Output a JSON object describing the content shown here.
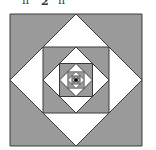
{
  "caption_fragment": {
    "left_mark": "n",
    "denominator": "2",
    "right_mark": "n"
  },
  "diagram": {
    "type": "nested-squares-and-diamonds",
    "center": [
      76,
      80
    ],
    "outer_half_size": 66,
    "levels": 7,
    "ratio": 0.5,
    "colors": {
      "shaded": "#9a9a9a",
      "unshaded": "#ffffff",
      "stroke": "#3a3a3a",
      "center_dot": "#000000"
    }
  }
}
